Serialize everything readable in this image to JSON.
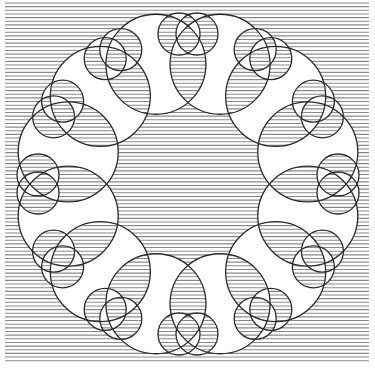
{
  "figure": {
    "background_color": "#ffffff",
    "line_color": "#8a8a8a",
    "stroke_color": "#2a2a2a",
    "line_pitch_px": 3.65,
    "grating_bounds": {
      "x0": 5,
      "y0": 3,
      "x1": 369,
      "y1": 362
    },
    "center": {
      "x": 188,
      "y": 184
    },
    "lobe_count": 12,
    "big_circle_radius": 50,
    "big_circle_ring_radius": 124,
    "heart_ring_radius": 150,
    "heart_lobe_radius": 21,
    "heart_lobe_separation": 18
  }
}
